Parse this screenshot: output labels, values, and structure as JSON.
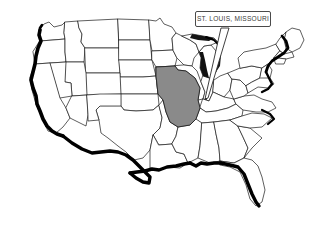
{
  "figure": {
    "type": "map",
    "region": "United States (contiguous 48 states)",
    "background_color": "#ffffff",
    "outline_color": "#1a1a1a",
    "coast_emphasis_color": "#000000",
    "highlight_fill": "#8a8a8a",
    "highlight_state": "Missouri"
  },
  "callout": {
    "label": "ST. LOUIS, MISSOURI",
    "box_fill": "#ffffff",
    "box_border": "#4a4a4a",
    "leader_color": "#2a2a2a",
    "target_point": {
      "x": 206,
      "y": 99
    }
  }
}
